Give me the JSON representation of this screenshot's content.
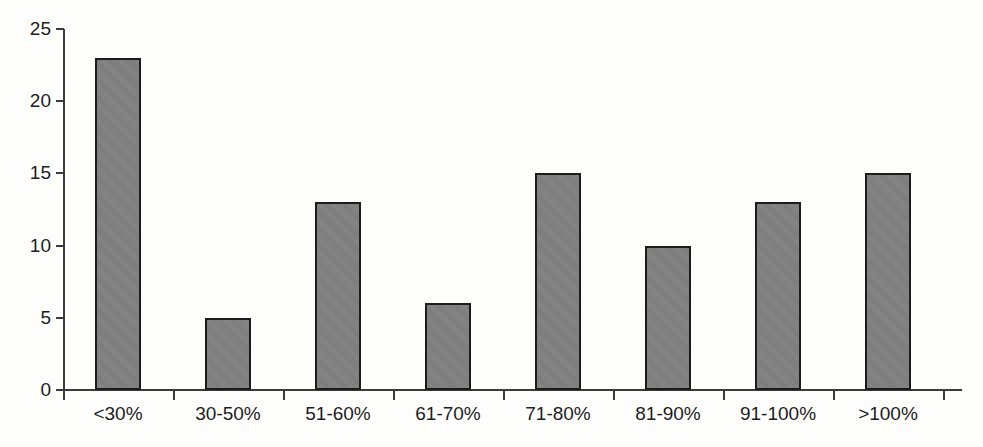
{
  "chart_data": {
    "type": "bar",
    "title": "",
    "subtitle": "",
    "xlabel": "",
    "ylabel": "",
    "categories": [
      "<30%",
      "30-50%",
      "51-60%",
      "61-70%",
      "71-80%",
      "81-90%",
      "91-100%",
      ">100%"
    ],
    "values": [
      23,
      5,
      13,
      6,
      15,
      10,
      13,
      15
    ],
    "ylim": [
      0,
      25
    ],
    "y_ticks": [
      0,
      5,
      10,
      15,
      20,
      25
    ],
    "y_tick_labels": [
      "0",
      "5",
      "10",
      "15",
      "20",
      "25"
    ],
    "grid": false,
    "legend": false,
    "legend_position": "none",
    "annotations": [],
    "colors": {
      "bar_fill": "#808080",
      "bar_border": "#1c1c1c",
      "axis": "#3b3b3b",
      "text": "#1d1d1d",
      "background": "#fdfdfc"
    }
  }
}
